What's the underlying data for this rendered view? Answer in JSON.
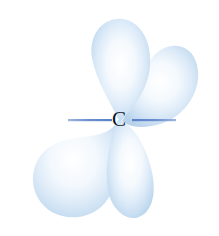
{
  "figure": {
    "background_color": "#ffffff",
    "width": 219,
    "height": 236
  },
  "atom": {
    "label": "C",
    "label_color": "#0c1526",
    "center_x": 120,
    "center_y": 120
  },
  "bond_line": {
    "name": "horizontal-bond-line",
    "color": "#6d8fd0",
    "left_start_x": 68,
    "left_end_x": 112,
    "right_start_x": 132,
    "right_end_x": 176,
    "y": 120,
    "thickness": 2
  },
  "colors": {
    "lobe_edge": "#b5d1ea",
    "lobe_mid": "#d3e5f6",
    "lobe_core": "#ffffff",
    "bond": "#6d8fd0",
    "label": "#0c1526",
    "background": "#ffffff"
  },
  "lobes": [
    {
      "name": "lobe-top-left",
      "direction": "up",
      "angle_deg": -4,
      "tip_x": 120,
      "tip_y": 120,
      "bulb_cx": 118,
      "bulb_cy": 55,
      "bulb_rx": 33,
      "bulb_ry": 40
    },
    {
      "name": "lobe-upper-right",
      "direction": "up-right",
      "angle_deg": 38,
      "tip_x": 120,
      "tip_y": 120,
      "bulb_cx": 166,
      "bulb_cy": 79,
      "bulb_rx": 29,
      "bulb_ry": 36
    },
    {
      "name": "lobe-lower-left",
      "direction": "down-left",
      "angle_deg": -145,
      "tip_x": 120,
      "tip_y": 120,
      "bulb_cx": 73,
      "bulb_cy": 177,
      "bulb_rx": 38,
      "bulb_ry": 42
    },
    {
      "name": "lobe-lower-right",
      "direction": "down",
      "angle_deg": 172,
      "tip_x": 120,
      "tip_y": 120,
      "bulb_cx": 127,
      "bulb_cy": 183,
      "bulb_rx": 26,
      "bulb_ry": 41
    }
  ]
}
